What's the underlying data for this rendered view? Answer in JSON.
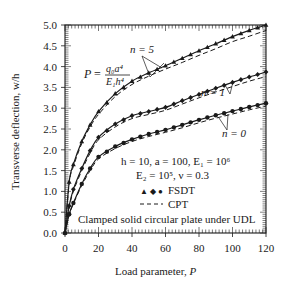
{
  "chart_data": {
    "type": "line",
    "title": "",
    "xlabel": "Load parameter, P",
    "ylabel": "Transverse deflection, w/h",
    "xlim": [
      0,
      120
    ],
    "ylim": [
      0.0,
      5.0
    ],
    "x_ticks": [
      "0",
      "20",
      "40",
      "60",
      "80",
      "100",
      "120"
    ],
    "y_ticks": [
      "0.0",
      "0.5",
      "1.0",
      "1.5",
      "2.0",
      "2.5",
      "3.0",
      "3.5",
      "4.0",
      "4.5",
      "5.0"
    ],
    "grid": false,
    "legend_position": "lower-right inside",
    "legend": [
      {
        "label": "FSDT",
        "style": "markers ▲ ◆ ●",
        "symbol": "▲ ◆ ●"
      },
      {
        "label": "CPT",
        "style": "dashed",
        "symbol": "- - -"
      }
    ],
    "x": [
      0,
      2.5,
      5,
      10,
      15,
      20,
      30,
      40,
      50,
      60,
      70,
      80,
      90,
      100,
      110,
      120
    ],
    "series": [
      {
        "name": "n = 5, FSDT",
        "marker": "triangle",
        "values": [
          0,
          1.23,
          1.65,
          2.2,
          2.6,
          2.92,
          3.35,
          3.65,
          3.85,
          4.02,
          4.2,
          4.38,
          4.55,
          4.72,
          4.87,
          5.0
        ]
      },
      {
        "name": "n = 5, CPT",
        "style": "dashed",
        "values": [
          0,
          1.2,
          1.6,
          2.15,
          2.55,
          2.85,
          3.28,
          3.57,
          3.77,
          3.94,
          4.1,
          4.27,
          4.43,
          4.6,
          4.73,
          4.87
        ]
      },
      {
        "name": "n = 1, FSDT",
        "marker": "diamond",
        "values": [
          0,
          0.65,
          1.05,
          1.55,
          1.98,
          2.3,
          2.62,
          2.82,
          2.92,
          3.02,
          3.18,
          3.33,
          3.48,
          3.62,
          3.75,
          3.87
        ]
      },
      {
        "name": "n = 1, CPT",
        "style": "dashed",
        "values": [
          0,
          0.62,
          1.0,
          1.5,
          1.92,
          2.24,
          2.55,
          2.75,
          2.85,
          2.95,
          3.1,
          3.25,
          3.39,
          3.52,
          3.65,
          3.76
        ]
      },
      {
        "name": "n = 0, FSDT",
        "marker": "circle",
        "values": [
          0,
          0.45,
          0.72,
          1.18,
          1.55,
          1.83,
          2.08,
          2.25,
          2.38,
          2.48,
          2.6,
          2.72,
          2.83,
          2.93,
          3.03,
          3.12
        ]
      },
      {
        "name": "n = 0, CPT",
        "style": "dashed",
        "values": [
          0,
          0.43,
          0.7,
          1.14,
          1.5,
          1.78,
          2.03,
          2.2,
          2.32,
          2.42,
          2.53,
          2.65,
          2.76,
          2.86,
          2.96,
          3.05
        ]
      }
    ],
    "annotations": [
      {
        "text": "P = q₀a⁴ / E₁h⁴",
        "position": "upper-left"
      },
      {
        "text": "n = 5",
        "position": "top-center"
      },
      {
        "text": "n = 1",
        "position": "right-middle"
      },
      {
        "text": "n = 0",
        "position": "right-lower"
      },
      {
        "text": "h = 10, a = 100, E₁ = 10⁶"
      },
      {
        "text": "E₂ = 10⁵, ν = 0.3"
      },
      {
        "text": "Clamped solid circular plate under UDL"
      }
    ]
  },
  "labels": {
    "xlabel": "Load parameter, ",
    "xlabel_var": "P",
    "ylabel": "Transverse deflection, w/h",
    "formula_lhs": "P",
    "formula_eq": "=",
    "formula_num": "q₀a⁴",
    "formula_den": "E₁h⁴",
    "n5": "n = 5",
    "n1": "n = 1",
    "n0": "n = 0",
    "params1": "h = 10, a = 100, E₁ = 10⁶",
    "params2": "E₂ = 10⁵, ν = 0.3",
    "legend_fsdt_symbol": "▲ ◆ ●",
    "legend_fsdt": "FSDT",
    "legend_cpt": "CPT",
    "caption": "Clamped solid circular plate  under UDL"
  }
}
